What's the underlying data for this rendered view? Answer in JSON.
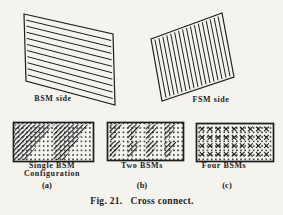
{
  "figure": {
    "caption": "Fig. 21.   Cross connect.",
    "panels": {
      "bsm": {
        "label": "BSM side",
        "stripe_count": 10,
        "stripe_orientation": "horizontal"
      },
      "fsm": {
        "label": "FSM side",
        "stripe_count": 17,
        "stripe_orientation": "vertical"
      }
    },
    "configs": [
      {
        "line1": "Single BSM",
        "line2": "Configuration",
        "tag": "(a)"
      },
      {
        "line1": "Two BSMs",
        "line2": "",
        "tag": "(b)"
      },
      {
        "line1": "Four BSMs",
        "line2": "",
        "tag": "(c)"
      }
    ],
    "ink_color": "#1d1d1d",
    "paper_color": "#f5f3ee"
  }
}
